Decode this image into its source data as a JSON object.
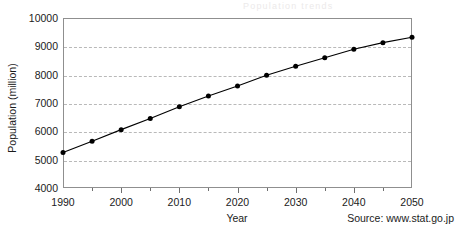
{
  "chart_data": {
    "type": "line",
    "title": "",
    "xlabel": "Year",
    "ylabel": "Population (million)",
    "xlim": [
      1990,
      2050
    ],
    "ylim": [
      4000,
      10000
    ],
    "yticks": [
      4000,
      5000,
      6000,
      7000,
      8000,
      9000,
      10000
    ],
    "xticks": [
      1990,
      2000,
      2010,
      2020,
      2030,
      2040,
      2050
    ],
    "xminor_ticks": [
      1995,
      2005,
      2015,
      2025,
      2035,
      2045
    ],
    "grid": "horizontal-dashed",
    "legend": "none",
    "marker": "filled-circle",
    "line_color": "#000000",
    "x": [
      1990,
      1995,
      2000,
      2005,
      2010,
      2015,
      2020,
      2025,
      2030,
      2035,
      2040,
      2045,
      2050
    ],
    "values": [
      5250,
      5650,
      6060,
      6450,
      6870,
      7250,
      7600,
      7980,
      8300,
      8600,
      8900,
      9130,
      9320
    ],
    "series": [
      {
        "name": "Population",
        "values": [
          5250,
          5650,
          6060,
          6450,
          6870,
          7250,
          7600,
          7980,
          8300,
          8600,
          8900,
          9130,
          9320
        ]
      }
    ],
    "annotations": [
      {
        "name": "source",
        "text": "Source: www.stat.go.jp",
        "position": "bottom-right"
      }
    ]
  },
  "axes": {
    "y_title": "Population (million)",
    "x_title": "Year",
    "y_tick_labels": [
      "10000",
      "9000",
      "8000",
      "7000",
      "6000",
      "5000",
      "4000"
    ],
    "x_tick_labels": [
      "1990",
      "2000",
      "2010",
      "2020",
      "2030",
      "2040",
      "2050"
    ]
  },
  "footer": {
    "source": "Source: www.stat.go.jp"
  },
  "artifact": {
    "ghost_text": "Population trends"
  }
}
